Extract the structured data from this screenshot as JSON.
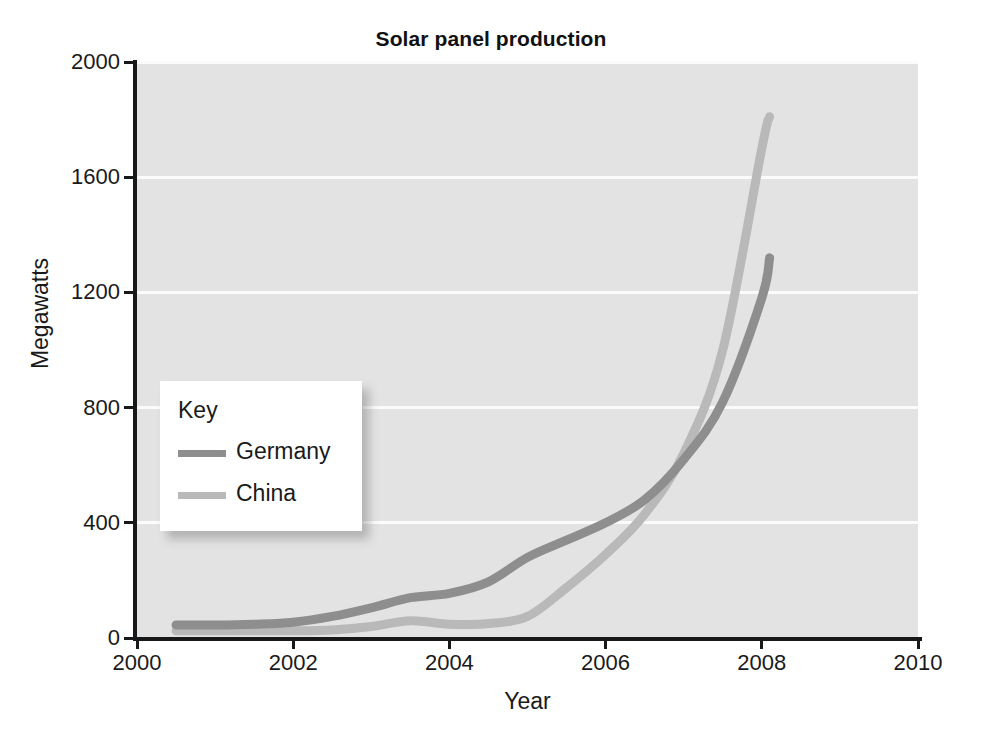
{
  "chart_data": {
    "type": "line",
    "title": "Solar panel production",
    "xlabel": "Year",
    "ylabel": "Megawatts",
    "xlim": [
      2000,
      2010
    ],
    "ylim": [
      0,
      2000
    ],
    "xticks": [
      2000,
      2002,
      2004,
      2006,
      2008,
      2010
    ],
    "yticks": [
      0,
      400,
      800,
      1200,
      1600,
      2000
    ],
    "grid": "horizontal",
    "legend_position": "inside-left",
    "legend_title": "Key",
    "plot_background": "#e3e3e3",
    "gridline_color": "#fbfbfb",
    "series": [
      {
        "name": "Germany",
        "color": "#8e8e8e",
        "x": [
          2000.5,
          2001.0,
          2001.5,
          2002.0,
          2002.5,
          2003.0,
          2003.5,
          2004.0,
          2004.5,
          2005.0,
          2005.5,
          2006.0,
          2006.5,
          2007.0,
          2007.5,
          2008.0,
          2008.1
        ],
        "values": [
          45,
          45,
          48,
          55,
          75,
          105,
          140,
          155,
          195,
          280,
          340,
          400,
          480,
          620,
          820,
          1180,
          1320
        ]
      },
      {
        "name": "China",
        "color": "#b9b9b9",
        "x": [
          2000.5,
          2001.0,
          2001.5,
          2002.0,
          2002.5,
          2003.0,
          2003.5,
          2004.0,
          2004.5,
          2005.0,
          2005.5,
          2006.0,
          2006.5,
          2007.0,
          2007.5,
          2008.0,
          2008.1
        ],
        "values": [
          25,
          25,
          25,
          25,
          28,
          40,
          60,
          48,
          50,
          75,
          175,
          290,
          430,
          640,
          1000,
          1700,
          1810
        ]
      }
    ]
  },
  "legend": {
    "title": "Key",
    "entries": [
      {
        "label": "Germany",
        "color": "#8e8e8e"
      },
      {
        "label": "China",
        "color": "#b9b9b9"
      }
    ]
  },
  "axes": {
    "y_title": "Megawatts",
    "x_title": "Year",
    "y_tick_labels": [
      "0",
      "400",
      "800",
      "1200",
      "1600",
      "2000"
    ],
    "x_tick_labels": [
      "2000",
      "2002",
      "2004",
      "2006",
      "2008",
      "2010"
    ]
  }
}
